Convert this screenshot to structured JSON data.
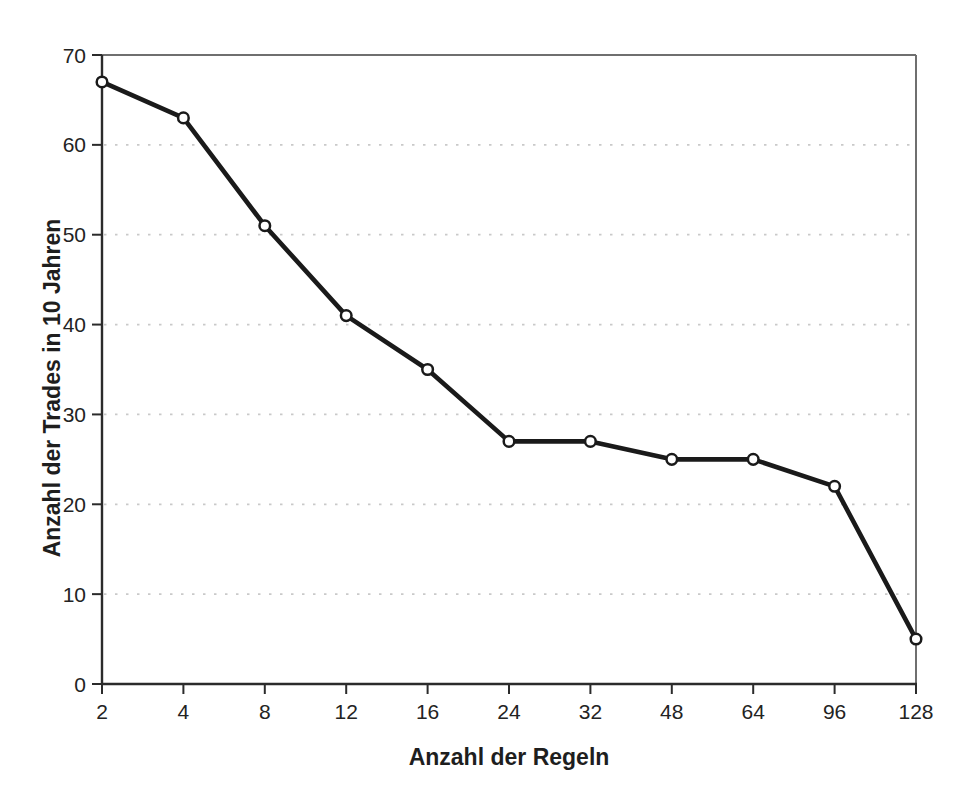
{
  "chart_data": {
    "type": "line",
    "title": "",
    "xlabel": "Anzahl der Regeln",
    "ylabel": "Anzahl der Trades in 10 Jahren",
    "categories": [
      "2",
      "4",
      "8",
      "12",
      "16",
      "24",
      "32",
      "48",
      "64",
      "96",
      "128"
    ],
    "series": [
      {
        "name": "Anzahl der Trades in 10 Jahren",
        "values": [
          67,
          63,
          51,
          41,
          35,
          27,
          27,
          25,
          25,
          22,
          5
        ]
      }
    ],
    "ylim": [
      0,
      70
    ],
    "yticks": [
      0,
      10,
      20,
      30,
      40,
      50,
      60,
      70
    ],
    "grid": "horizontal-dotted",
    "legend_position": "none",
    "marker": "open-circle",
    "colors": {
      "line": "#1a1a1a",
      "marker_fill": "#ffffff",
      "grid": "#c9c9c9",
      "axis": "#2b2b2b",
      "plot_border": "#6f6f6f",
      "text": "#232323",
      "background": "#ffffff"
    }
  }
}
